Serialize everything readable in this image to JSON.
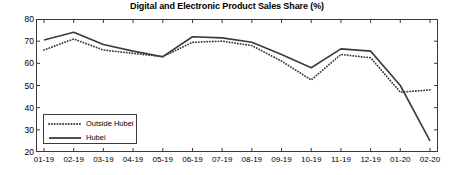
{
  "chart_data": {
    "type": "line",
    "title": "Digital and Electronic Product Sales Share (%)",
    "xlabel": "",
    "ylabel": "",
    "ylim": [
      20,
      80
    ],
    "yticks": [
      20,
      30,
      40,
      50,
      60,
      70,
      80
    ],
    "grid": false,
    "legend_position": "lower-left",
    "categories": [
      "01-19",
      "02-19",
      "03-19",
      "04-19",
      "05-19",
      "06-19",
      "07-19",
      "08-19",
      "09-19",
      "10-19",
      "11-19",
      "12-19",
      "01-20",
      "02-20"
    ],
    "series": [
      {
        "name": "Outside Hubei",
        "style": "dotted",
        "color": "#3a3a3a",
        "values": [
          66,
          71,
          66,
          64.5,
          63,
          69.5,
          70,
          68,
          61,
          52.5,
          64,
          62.5,
          47,
          48
        ]
      },
      {
        "name": "Hubei",
        "style": "solid",
        "color": "#3a3a3a",
        "values": [
          70.5,
          74,
          68.5,
          65.5,
          63,
          72,
          71.5,
          69.5,
          64,
          58,
          66.5,
          65.5,
          50,
          25
        ]
      }
    ]
  },
  "legend": {
    "items": [
      {
        "label": "Outside Hubei",
        "style": "dotted"
      },
      {
        "label": "Hubei",
        "style": "solid"
      }
    ]
  },
  "axes": {
    "ytick_labels": [
      "80",
      "70",
      "60",
      "50",
      "40",
      "30",
      "20"
    ],
    "xtick_labels": [
      "01-19",
      "02-19",
      "03-19",
      "04-19",
      "05-19",
      "06-19",
      "07-19",
      "08-19",
      "09-19",
      "10-19",
      "11-19",
      "12-19",
      "01-20",
      "02-20"
    ]
  }
}
